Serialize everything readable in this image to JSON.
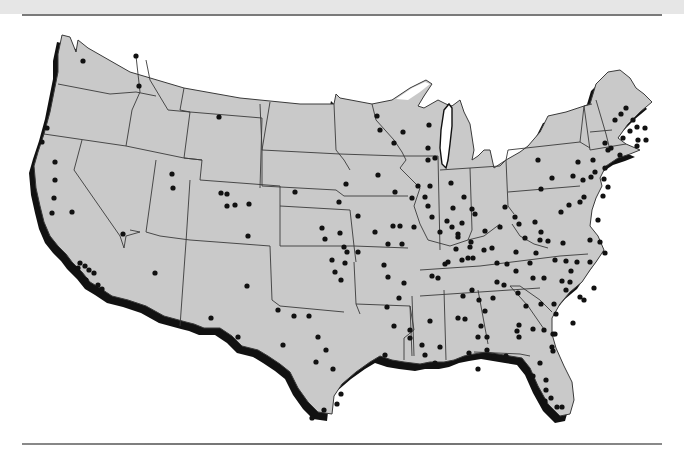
{
  "map": {
    "title": "",
    "region": "Contiguous United States",
    "style": {
      "land_color": "#c9c9c9",
      "border_color": "#3a3a3a",
      "shadow_color": "#111111",
      "dot_color": "#111111",
      "background": "#ffffff"
    },
    "marker_icon": "filled-circle-dot",
    "dots": [
      [
        47,
        128
      ],
      [
        42,
        142
      ],
      [
        83,
        61
      ],
      [
        136,
        56
      ],
      [
        139,
        86
      ],
      [
        219,
        117
      ],
      [
        55,
        162
      ],
      [
        55,
        180
      ],
      [
        54,
        198
      ],
      [
        52,
        213
      ],
      [
        72,
        212
      ],
      [
        123,
        234
      ],
      [
        172,
        174
      ],
      [
        173,
        188
      ],
      [
        227,
        194
      ],
      [
        221,
        193
      ],
      [
        227,
        206
      ],
      [
        235,
        205
      ],
      [
        249,
        204
      ],
      [
        248,
        236
      ],
      [
        295,
        192
      ],
      [
        155,
        273
      ],
      [
        211,
        318
      ],
      [
        247,
        286
      ],
      [
        238,
        337
      ],
      [
        80,
        263
      ],
      [
        85,
        266
      ],
      [
        78,
        268
      ],
      [
        89,
        270
      ],
      [
        94,
        273
      ],
      [
        86,
        280
      ],
      [
        98,
        285
      ],
      [
        102,
        289
      ],
      [
        377,
        116
      ],
      [
        380,
        130
      ],
      [
        403,
        132
      ],
      [
        394,
        143
      ],
      [
        429,
        125
      ],
      [
        428,
        148
      ],
      [
        428,
        160
      ],
      [
        435,
        158
      ],
      [
        378,
        175
      ],
      [
        395,
        192
      ],
      [
        412,
        198
      ],
      [
        430,
        186
      ],
      [
        428,
        206
      ],
      [
        451,
        183
      ],
      [
        464,
        197
      ],
      [
        472,
        209
      ],
      [
        346,
        184
      ],
      [
        339,
        202
      ],
      [
        358,
        216
      ],
      [
        322,
        228
      ],
      [
        340,
        233
      ],
      [
        393,
        226
      ],
      [
        400,
        226
      ],
      [
        414,
        227
      ],
      [
        325,
        239
      ],
      [
        344,
        247
      ],
      [
        358,
        252
      ],
      [
        332,
        260
      ],
      [
        335,
        272
      ],
      [
        345,
        263
      ],
      [
        341,
        280
      ],
      [
        347,
        252
      ],
      [
        375,
        232
      ],
      [
        388,
        244
      ],
      [
        402,
        244
      ],
      [
        384,
        265
      ],
      [
        404,
        283
      ],
      [
        388,
        277
      ],
      [
        387,
        307
      ],
      [
        399,
        298
      ],
      [
        394,
        326
      ],
      [
        410,
        330
      ],
      [
        422,
        345
      ],
      [
        425,
        355
      ],
      [
        440,
        347
      ],
      [
        385,
        355
      ],
      [
        430,
        321
      ],
      [
        278,
        310
      ],
      [
        294,
        316
      ],
      [
        309,
        316
      ],
      [
        318,
        337
      ],
      [
        283,
        345
      ],
      [
        326,
        350
      ],
      [
        316,
        362
      ],
      [
        333,
        369
      ],
      [
        341,
        394
      ],
      [
        337,
        404
      ],
      [
        324,
        410
      ],
      [
        312,
        418
      ],
      [
        418,
        186
      ],
      [
        425,
        197
      ],
      [
        453,
        208
      ],
      [
        447,
        221
      ],
      [
        462,
        223
      ],
      [
        475,
        214
      ],
      [
        432,
        217
      ],
      [
        452,
        227
      ],
      [
        458,
        234
      ],
      [
        485,
        231
      ],
      [
        500,
        227
      ],
      [
        470,
        247
      ],
      [
        505,
        207
      ],
      [
        515,
        217
      ],
      [
        519,
        224
      ],
      [
        535,
        222
      ],
      [
        525,
        238
      ],
      [
        541,
        232
      ],
      [
        445,
        264
      ],
      [
        462,
        260
      ],
      [
        473,
        258
      ],
      [
        484,
        250
      ],
      [
        492,
        248
      ],
      [
        516,
        252
      ],
      [
        497,
        263
      ],
      [
        432,
        276
      ],
      [
        438,
        278
      ],
      [
        448,
        262
      ],
      [
        440,
        232
      ],
      [
        458,
        237
      ],
      [
        471,
        242
      ],
      [
        538,
        160
      ],
      [
        552,
        178
      ],
      [
        541,
        189
      ],
      [
        573,
        176
      ],
      [
        578,
        162
      ],
      [
        584,
        197
      ],
      [
        561,
        212
      ],
      [
        569,
        205
      ],
      [
        580,
        202
      ],
      [
        583,
        180
      ],
      [
        591,
        177
      ],
      [
        605,
        168
      ],
      [
        603,
        196
      ],
      [
        598,
        220
      ],
      [
        590,
        240
      ],
      [
        540,
        240
      ],
      [
        563,
        243
      ],
      [
        600,
        242
      ],
      [
        605,
        253
      ],
      [
        590,
        262
      ],
      [
        566,
        261
      ],
      [
        555,
        260
      ],
      [
        548,
        241
      ],
      [
        536,
        253
      ],
      [
        530,
        263
      ],
      [
        516,
        271
      ],
      [
        507,
        264
      ],
      [
        533,
        278
      ],
      [
        544,
        278
      ],
      [
        571,
        271
      ],
      [
        577,
        262
      ],
      [
        570,
        282
      ],
      [
        562,
        281
      ],
      [
        566,
        290
      ],
      [
        580,
        297
      ],
      [
        594,
        288
      ],
      [
        584,
        300
      ],
      [
        504,
        285
      ],
      [
        497,
        282
      ],
      [
        493,
        298
      ],
      [
        472,
        290
      ],
      [
        463,
        296
      ],
      [
        479,
        300
      ],
      [
        481,
        326
      ],
      [
        458,
        318
      ],
      [
        485,
        311
      ],
      [
        465,
        319
      ],
      [
        478,
        337
      ],
      [
        487,
        337
      ],
      [
        469,
        353
      ],
      [
        487,
        350
      ],
      [
        478,
        369
      ],
      [
        518,
        293
      ],
      [
        526,
        306
      ],
      [
        533,
        329
      ],
      [
        519,
        325
      ],
      [
        541,
        304
      ],
      [
        554,
        304
      ],
      [
        544,
        330
      ],
      [
        553,
        334
      ],
      [
        555,
        334
      ],
      [
        553,
        351
      ],
      [
        573,
        323
      ],
      [
        556,
        314
      ],
      [
        552,
        347
      ],
      [
        468,
        258
      ],
      [
        456,
        249
      ],
      [
        506,
        356
      ],
      [
        540,
        363
      ],
      [
        533,
        376
      ],
      [
        537,
        392
      ],
      [
        546,
        380
      ],
      [
        546,
        390
      ],
      [
        551,
        398
      ],
      [
        545,
        401
      ],
      [
        557,
        407
      ],
      [
        562,
        407
      ],
      [
        519,
        337
      ],
      [
        517,
        331
      ],
      [
        494,
        356
      ],
      [
        435,
        363
      ],
      [
        410,
        338
      ],
      [
        626,
        108
      ],
      [
        621,
        114
      ],
      [
        633,
        120
      ],
      [
        615,
        120
      ],
      [
        623,
        138
      ],
      [
        630,
        131
      ],
      [
        637,
        127
      ],
      [
        645,
        128
      ],
      [
        638,
        140
      ],
      [
        646,
        140
      ],
      [
        611,
        148
      ],
      [
        605,
        143
      ],
      [
        620,
        155
      ],
      [
        637,
        146
      ],
      [
        593,
        160
      ],
      [
        608,
        150
      ],
      [
        595,
        172
      ],
      [
        604,
        179
      ],
      [
        608,
        187
      ]
    ]
  },
  "footer": {
    "rule": "horizontal-divider"
  }
}
